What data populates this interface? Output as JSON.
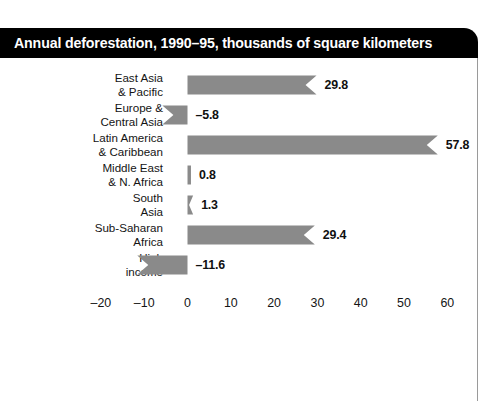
{
  "title": "Annual deforestation, 1990–95, thousands of square kilometers",
  "colors": {
    "bar": "#8a8a8a",
    "title_bar": "#000000",
    "title_text": "#ffffff",
    "text": "#141414",
    "frame_rule": "#9a9a9a"
  },
  "chart_data": {
    "type": "bar",
    "orientation": "horizontal",
    "title": "Annual deforestation, 1990–95, thousands of square kilometers",
    "xlabel": "",
    "ylabel": "",
    "xlim": [
      -20,
      65
    ],
    "grid": false,
    "legend": false,
    "categories": [
      "East Asia & Pacific",
      "Europe & Central Asia",
      "Latin America & Caribbean",
      "Middle East & N. Africa",
      "South Asia",
      "Sub-Saharan Africa",
      "High income"
    ],
    "values": [
      29.8,
      -5.8,
      57.8,
      0.8,
      1.3,
      29.4,
      -11.6
    ],
    "value_labels": [
      "29.8",
      "–5.8",
      "57.8",
      "0.8",
      "1.3",
      "29.4",
      "–11.6"
    ],
    "xticks": [
      -20,
      -10,
      0,
      10,
      20,
      30,
      40,
      50,
      60
    ],
    "xtick_labels": [
      "–20",
      "–10",
      "0",
      "10",
      "20",
      "30",
      "40",
      "50",
      "60"
    ]
  },
  "rows": [
    {
      "label_line1": "East Asia",
      "label_line2": "& Pacific",
      "value": 29.8,
      "value_label": "29.8"
    },
    {
      "label_line1": "Europe &",
      "label_line2": "Central Asia",
      "value": -5.8,
      "value_label": "–5.8"
    },
    {
      "label_line1": "Latin America",
      "label_line2": "& Caribbean",
      "value": 57.8,
      "value_label": "57.8"
    },
    {
      "label_line1": "Middle East",
      "label_line2": "& N. Africa",
      "value": 0.8,
      "value_label": "0.8"
    },
    {
      "label_line1": "South",
      "label_line2": "Asia",
      "value": 1.3,
      "value_label": "1.3"
    },
    {
      "label_line1": "Sub-Saharan",
      "label_line2": "Africa",
      "value": 29.4,
      "value_label": "29.4"
    },
    {
      "label_line1": "High",
      "label_line2": "income",
      "value": -11.6,
      "value_label": "–11.6"
    }
  ],
  "axis": {
    "ticks": [
      "–20",
      "–10",
      "0",
      "10",
      "20",
      "30",
      "40",
      "50",
      "60"
    ],
    "tick_values": [
      -20,
      -10,
      0,
      10,
      20,
      30,
      40,
      50,
      60
    ]
  }
}
